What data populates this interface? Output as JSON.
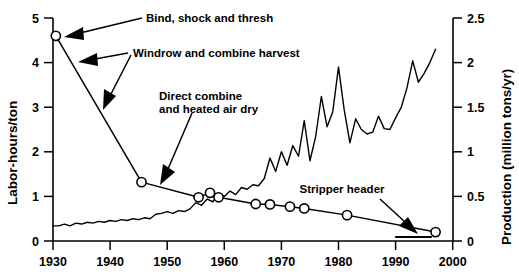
{
  "chart_data": {
    "type": "line",
    "title": "",
    "xlabel": "",
    "ylabel": "Labor-hours/ton",
    "y2label": "Production (million tons/yr)",
    "xlim": [
      1930,
      2000
    ],
    "ylim": [
      0,
      5
    ],
    "y2lim": [
      0,
      2.5
    ],
    "grid": false,
    "legend": "none",
    "xticks": [
      "1930",
      "1940",
      "1950",
      "1960",
      "1970",
      "1980",
      "1990",
      "2000"
    ],
    "yticks": [
      "0",
      "1",
      "2",
      "3",
      "4",
      "5"
    ],
    "y2ticks": [
      "0",
      "0.5",
      "1",
      "1.5",
      "2",
      "2.5"
    ],
    "series": [
      {
        "name": "Labor-hours/ton",
        "axis": "left",
        "marker": "open-circle",
        "x": [
          1930.5,
          1945.5,
          1955.5,
          1957.5,
          1959,
          1965.5,
          1968,
          1971.5,
          1974,
          1981.5,
          1997
        ],
        "values": [
          4.6,
          1.32,
          0.98,
          1.08,
          0.98,
          0.83,
          0.82,
          0.77,
          0.73,
          0.58,
          0.2
        ]
      },
      {
        "name": "Production",
        "axis": "right",
        "marker": "none",
        "x": [
          1930,
          1931,
          1932,
          1933,
          1934,
          1935,
          1936,
          1937,
          1938,
          1939,
          1940,
          1941,
          1942,
          1943,
          1944,
          1945,
          1946,
          1947,
          1948,
          1949,
          1950,
          1951,
          1952,
          1953,
          1954,
          1955,
          1956,
          1957,
          1958,
          1959,
          1960,
          1961,
          1962,
          1963,
          1964,
          1965,
          1966,
          1967,
          1968,
          1969,
          1970,
          1971,
          1972,
          1973,
          1974,
          1975,
          1976,
          1977,
          1978,
          1979,
          1980,
          1981,
          1982,
          1983,
          1984,
          1985,
          1986,
          1987,
          1988,
          1989,
          1990,
          1991,
          1992,
          1993,
          1994,
          1995,
          1996,
          1997
        ],
        "values": [
          0.17,
          0.17,
          0.19,
          0.17,
          0.2,
          0.19,
          0.21,
          0.2,
          0.22,
          0.21,
          0.23,
          0.22,
          0.24,
          0.23,
          0.25,
          0.24,
          0.26,
          0.25,
          0.3,
          0.31,
          0.33,
          0.31,
          0.34,
          0.33,
          0.36,
          0.43,
          0.4,
          0.47,
          0.44,
          0.53,
          0.5,
          0.56,
          0.52,
          0.6,
          0.58,
          0.63,
          0.62,
          0.7,
          0.93,
          0.78,
          1.0,
          0.85,
          1.07,
          0.95,
          1.35,
          0.9,
          1.17,
          1.62,
          1.28,
          1.45,
          1.95,
          1.47,
          1.1,
          1.37,
          1.25,
          1.2,
          1.22,
          1.4,
          1.26,
          1.25,
          1.38,
          1.5,
          1.72,
          2.02,
          1.78,
          1.88,
          2.0,
          2.15
        ]
      }
    ],
    "annotations": [
      {
        "id": "bind-shock-thresh",
        "text": "Bind, shock and thresh"
      },
      {
        "id": "windrow-combine-harvest",
        "text": "Windrow and combine harvest"
      },
      {
        "id": "direct-combine-line1",
        "text": "Direct combine"
      },
      {
        "id": "direct-combine-line2",
        "text": "and heated air dry"
      },
      {
        "id": "stripper-header",
        "text": "Stripper header"
      }
    ]
  },
  "axes": {
    "left": {
      "title": "Labor-hours/ton",
      "ticks": [
        "5",
        "4",
        "3",
        "2",
        "1",
        "0"
      ]
    },
    "right": {
      "title": "Production (million tons/yr)",
      "ticks": [
        "2.5",
        "2",
        "1.5",
        "1",
        "0.5",
        "0"
      ]
    },
    "bottom": {
      "ticks": [
        "1930",
        "1940",
        "1950",
        "1960",
        "1970",
        "1980",
        "1990",
        "2000"
      ]
    }
  },
  "annotations": {
    "bind_shock_thresh": "Bind, shock and thresh",
    "windrow_combine": "Windrow and combine harvest",
    "direct_combine_1": "Direct combine",
    "direct_combine_2": "and heated air dry",
    "stripper_header": "Stripper header"
  }
}
